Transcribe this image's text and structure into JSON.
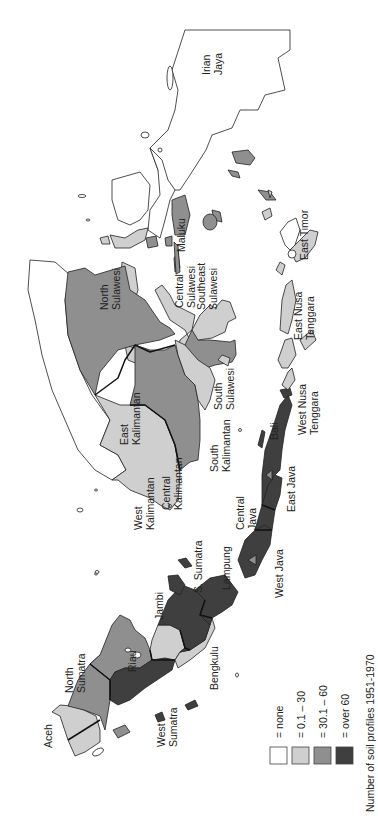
{
  "title": "Number of soil profiles 1951-1970",
  "orientation": "rotated 90 degrees counter-clockwise",
  "legend": [
    {
      "label": "= none",
      "color": "#ffffff"
    },
    {
      "label": "= 0.1 – 30",
      "color": "#cfcfcf"
    },
    {
      "label": "= 30.1 – 60",
      "color": "#8f8f8f"
    },
    {
      "label": "= over 60",
      "color": "#3f3f3f"
    }
  ],
  "regions": [
    {
      "name": "Aceh",
      "label": "Aceh",
      "class": "0.1 – 30"
    },
    {
      "name": "North Sumatra",
      "label": "North Sumatra",
      "class": "30.1 – 60"
    },
    {
      "name": "Riau",
      "label": "Riau",
      "class": "30.1 – 60"
    },
    {
      "name": "West Sumatra",
      "label": "West Sumatra",
      "class": "over 60"
    },
    {
      "name": "Jambi",
      "label": "Jambi",
      "class": "0.1 – 30"
    },
    {
      "name": "Bengkulu",
      "label": "Bengkulu",
      "class": "0.1 – 30"
    },
    {
      "name": "S. Sumatra",
      "label": "S. Sumatra",
      "class": "over 60"
    },
    {
      "name": "Lampung",
      "label": "Lampung",
      "class": "over 60"
    },
    {
      "name": "West Java",
      "label": "West Java",
      "class": "over 60"
    },
    {
      "name": "Central Java",
      "label": "Central Java",
      "class": "over 60"
    },
    {
      "name": "East Java",
      "label": "East Java",
      "class": "over 60"
    },
    {
      "name": "Bali",
      "label": "Bali",
      "class": "over 60"
    },
    {
      "name": "West Kalimantan",
      "label": "West Kalimantan",
      "class": "0.1 – 30"
    },
    {
      "name": "Central Kalimantan",
      "label": "Central Kalimantan",
      "class": "30.1 – 60"
    },
    {
      "name": "South Kalimantan",
      "label": "South Kalimantan",
      "class": "0.1 – 30"
    },
    {
      "name": "East Kalimantan",
      "label": "East Kalimantan",
      "class": "30.1 – 60"
    },
    {
      "name": "North Sulawesi",
      "label": "North Sulawesi",
      "class": "0.1 – 30"
    },
    {
      "name": "Central Sulawesi",
      "label": "Central Sulawesi",
      "class": "0.1 – 30"
    },
    {
      "name": "South Sulawesi",
      "label": "South Sulawesi",
      "class": "30.1 – 60"
    },
    {
      "name": "Southeast Sulawesi",
      "label": "Southeast Sulawesi",
      "class": "0.1 – 30"
    },
    {
      "name": "Maluku",
      "label": "Maluku",
      "class": "30.1 – 60"
    },
    {
      "name": "West Nusa Tenggara",
      "label": "West Nusa Tenggara",
      "class": "0.1 – 30"
    },
    {
      "name": "East Nusa Tenggara",
      "label": "East Nusa Tenggara",
      "class": "0.1 – 30"
    },
    {
      "name": "East Timor",
      "label": "East Timor",
      "class": "none"
    },
    {
      "name": "Irian Jaya",
      "label": "Irian Jaya",
      "class": "none"
    }
  ],
  "labels": {
    "aceh": "Aceh",
    "north_sumatra": [
      "North",
      "Sumatra"
    ],
    "riau": "Riau",
    "west_sumatra": [
      "West",
      "Sumatra"
    ],
    "jambi": "Jambi",
    "bengkulu": "Bengkulu",
    "s_sumatra": "S. Sumatra",
    "lampung": "Lampung",
    "west_java": "West Java",
    "central_java": [
      "Central",
      "Java"
    ],
    "east_java": "East Java",
    "bali": "Bali",
    "west_kalimantan": [
      "West",
      "Kalimantan"
    ],
    "central_kalimantan": [
      "Central",
      "Kalimantan"
    ],
    "south_kalimantan": [
      "South",
      "Kalimantan"
    ],
    "east_kalimantan": [
      "East",
      "Kalimantan"
    ],
    "north_sulawesi": [
      "North",
      "Sulawesi"
    ],
    "central_sulawesi": [
      "Central",
      "Sulawesi"
    ],
    "south_sulawesi": [
      "South",
      "Sulawesi"
    ],
    "southeast_sulawesi": [
      "Southeast",
      "Sulawesi"
    ],
    "maluku": "Maluku",
    "west_nusa_tenggara": [
      "West Nusa",
      "Tenggara"
    ],
    "east_nusa_tenggara": [
      "East Nusa",
      "Tenggara"
    ],
    "east_timor": "East Timor",
    "irian_jaya": [
      "Irian",
      "Jaya"
    ]
  }
}
